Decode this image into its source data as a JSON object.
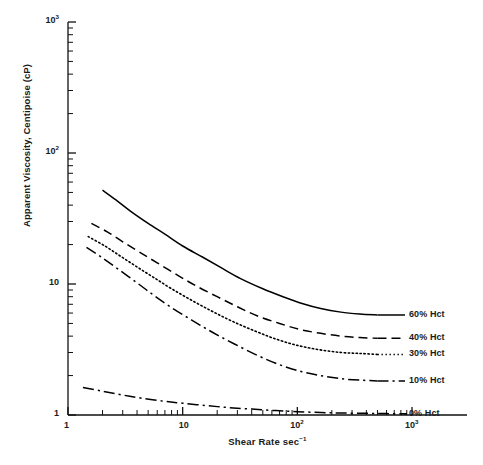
{
  "chart_data": {
    "type": "line",
    "title": "",
    "xlabel": "Shear Rate sec⁻¹",
    "ylabel": "Apparent Viscosity, Centipoise (cP)",
    "xscale": "log",
    "yscale": "log",
    "xlim": [
      1,
      1000
    ],
    "ylim": [
      1,
      1000
    ],
    "grid": false,
    "legend_position": "right-inline",
    "xticks": [
      {
        "value": 1,
        "label": "1"
      },
      {
        "value": 10,
        "label": "10"
      },
      {
        "value": 100,
        "label": "10",
        "sup": "2"
      },
      {
        "value": 1000,
        "label": "10",
        "sup": "3"
      }
    ],
    "yticks": [
      {
        "value": 1,
        "label": "1"
      },
      {
        "value": 10,
        "label": "10"
      },
      {
        "value": 100,
        "label": "10",
        "sup": "2"
      },
      {
        "value": 1000,
        "label": "10",
        "sup": "3"
      }
    ],
    "series": [
      {
        "name": "60% Hct",
        "label": "60% Hct",
        "style": "solid",
        "color": "#000000",
        "x": [
          2.0,
          2.6,
          3.5,
          5.0,
          7.0,
          10,
          15,
          22,
          32,
          50,
          75,
          110,
          160,
          240,
          350,
          500
        ],
        "values": [
          52.0,
          44.0,
          36.0,
          29.0,
          24.0,
          19.5,
          16.0,
          13.2,
          11.0,
          9.2,
          8.0,
          7.1,
          6.5,
          6.1,
          5.9,
          5.8
        ]
      },
      {
        "name": "40% Hct",
        "label": "40% Hct",
        "style": "dashed",
        "color": "#000000",
        "x": [
          1.6,
          2.2,
          3.0,
          4.2,
          6.0,
          9.0,
          13,
          20,
          30,
          45,
          70,
          105,
          160,
          240,
          350,
          500
        ],
        "values": [
          29.0,
          25.0,
          21.0,
          17.5,
          14.5,
          11.7,
          9.7,
          8.0,
          6.7,
          5.7,
          5.0,
          4.5,
          4.2,
          4.0,
          3.9,
          3.85
        ]
      },
      {
        "name": "30% Hct",
        "label": "30% Hct",
        "style": "dotted",
        "color": "#000000",
        "x": [
          1.5,
          2.1,
          2.9,
          4.0,
          5.6,
          8.0,
          12,
          18,
          27,
          42,
          65,
          100,
          155,
          240,
          350,
          500
        ],
        "values": [
          23.0,
          19.5,
          16.2,
          13.5,
          11.2,
          9.2,
          7.5,
          6.2,
          5.2,
          4.4,
          3.8,
          3.4,
          3.15,
          3.0,
          2.95,
          2.9
        ]
      },
      {
        "name": "10% Hct",
        "label": "10% Hct",
        "style": "dashdot",
        "color": "#000000",
        "x": [
          1.45,
          2.0,
          2.8,
          4.0,
          5.6,
          8.0,
          12,
          18,
          28,
          45,
          70,
          110,
          170,
          260,
          380,
          500
        ],
        "values": [
          19.0,
          15.8,
          12.8,
          10.2,
          8.2,
          6.6,
          5.3,
          4.3,
          3.5,
          2.85,
          2.42,
          2.14,
          1.98,
          1.88,
          1.84,
          1.82
        ]
      },
      {
        "name": "0% Hct",
        "label": "0% Hct",
        "style": "dashdot",
        "color": "#000000",
        "x": [
          1.35,
          2.0,
          3.0,
          4.5,
          7.0,
          10,
          16,
          25,
          40,
          65,
          100,
          160,
          250,
          400,
          600,
          900
        ],
        "values": [
          1.62,
          1.52,
          1.42,
          1.34,
          1.27,
          1.23,
          1.18,
          1.14,
          1.11,
          1.08,
          1.06,
          1.045,
          1.035,
          1.03,
          1.025,
          1.02
        ]
      }
    ]
  },
  "axis_titles": {
    "x": "Shear Rate sec",
    "x_sup": "-1",
    "y": "Apparent Viscosity, Centipoise (cP)"
  },
  "series_labels": [
    {
      "text": "60% Hct",
      "name": "label-60-hct"
    },
    {
      "text": "40% Hct",
      "name": "label-40-hct"
    },
    {
      "text": "30% Hct",
      "name": "label-30-hct"
    },
    {
      "text": "10% Hct",
      "name": "label-10-hct"
    },
    {
      "text": "0% Hct",
      "name": "label-0-hct"
    }
  ]
}
